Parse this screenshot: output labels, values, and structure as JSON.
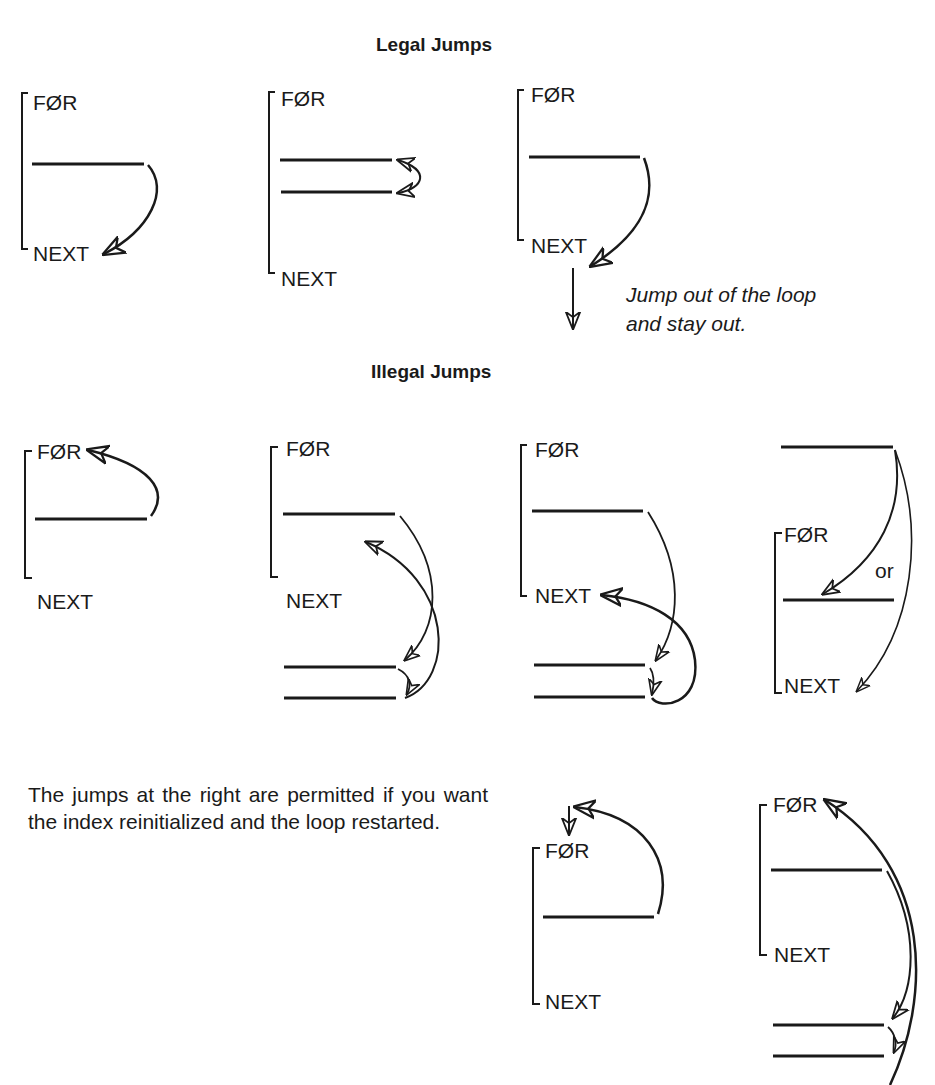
{
  "legal": {
    "title": "Legal Jumps",
    "diagrams": [
      {
        "for_label": "FØR",
        "next_label": "NEXT"
      },
      {
        "for_label": "FØR",
        "next_label": "NEXT"
      },
      {
        "for_label": "FØR",
        "next_label": "NEXT",
        "note_line1": "Jump out of the loop",
        "note_line2": "and stay out."
      }
    ]
  },
  "illegal": {
    "title": "Illegal Jumps",
    "diagrams": [
      {
        "for_label": "FØR",
        "next_label": "NEXT"
      },
      {
        "for_label": "FØR",
        "next_label": "NEXT"
      },
      {
        "for_label": "FØR",
        "next_label": "NEXT"
      },
      {
        "for_label": "FØR",
        "next_label": "NEXT",
        "or_label": "or"
      }
    ]
  },
  "restart": {
    "paragraph": "The jumps at the right are permitted if you want the index reinitialized and the loop restarted.",
    "diagrams": [
      {
        "for_label": "FØR",
        "next_label": "NEXT"
      },
      {
        "for_label": "FØR",
        "next_label": "NEXT"
      }
    ]
  },
  "colors": {
    "ink": "#1a1a1a",
    "background": "#ffffff"
  }
}
